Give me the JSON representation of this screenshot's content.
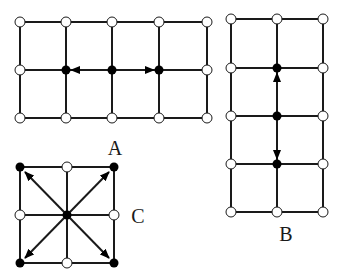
{
  "diagram": {
    "colors": {
      "line": "#1a1a1a",
      "filled_node": "#000000",
      "open_node_fill": "#ffffff",
      "background": "#ffffff"
    },
    "panels": [
      {
        "id": "A",
        "label": "A",
        "label_pos": [
          115,
          155
        ],
        "columns": [
          20,
          66,
          112,
          159,
          207
        ],
        "rows": [
          22,
          70,
          118
        ],
        "filled_nodes": [
          [
            66,
            70
          ],
          [
            112,
            70
          ],
          [
            159,
            70
          ]
        ],
        "arrows": [
          {
            "from": [
              112,
              70
            ],
            "to": [
              71,
              70
            ],
            "direction": "left"
          },
          {
            "from": [
              112,
              70
            ],
            "to": [
              154,
              70
            ],
            "direction": "right"
          }
        ]
      },
      {
        "id": "B",
        "label": "B",
        "label_pos": [
          286,
          241
        ],
        "columns": [
          231,
          277,
          323
        ],
        "rows": [
          19,
          68,
          116,
          164,
          212
        ],
        "filled_nodes": [
          [
            277,
            68
          ],
          [
            277,
            116
          ],
          [
            277,
            164
          ]
        ],
        "arrows": [
          {
            "from": [
              277,
              116
            ],
            "to": [
              277,
              73
            ],
            "direction": "up"
          },
          {
            "from": [
              277,
              116
            ],
            "to": [
              277,
              159
            ],
            "direction": "down"
          }
        ]
      },
      {
        "id": "C",
        "label": "C",
        "label_pos": [
          138,
          223
        ],
        "columns": [
          20,
          67,
          114
        ],
        "rows": [
          167,
          215,
          263
        ],
        "filled_nodes": [
          [
            20,
            167
          ],
          [
            114,
            167
          ],
          [
            67,
            215
          ],
          [
            20,
            263
          ],
          [
            114,
            263
          ]
        ],
        "arrows": [
          {
            "from": [
              67,
              215
            ],
            "to": [
              25,
              172
            ],
            "direction": "up-left"
          },
          {
            "from": [
              67,
              215
            ],
            "to": [
              109,
              172
            ],
            "direction": "up-right"
          },
          {
            "from": [
              67,
              215
            ],
            "to": [
              25,
              258
            ],
            "direction": "down-left"
          },
          {
            "from": [
              67,
              215
            ],
            "to": [
              109,
              258
            ],
            "direction": "down-right"
          }
        ]
      }
    ]
  }
}
